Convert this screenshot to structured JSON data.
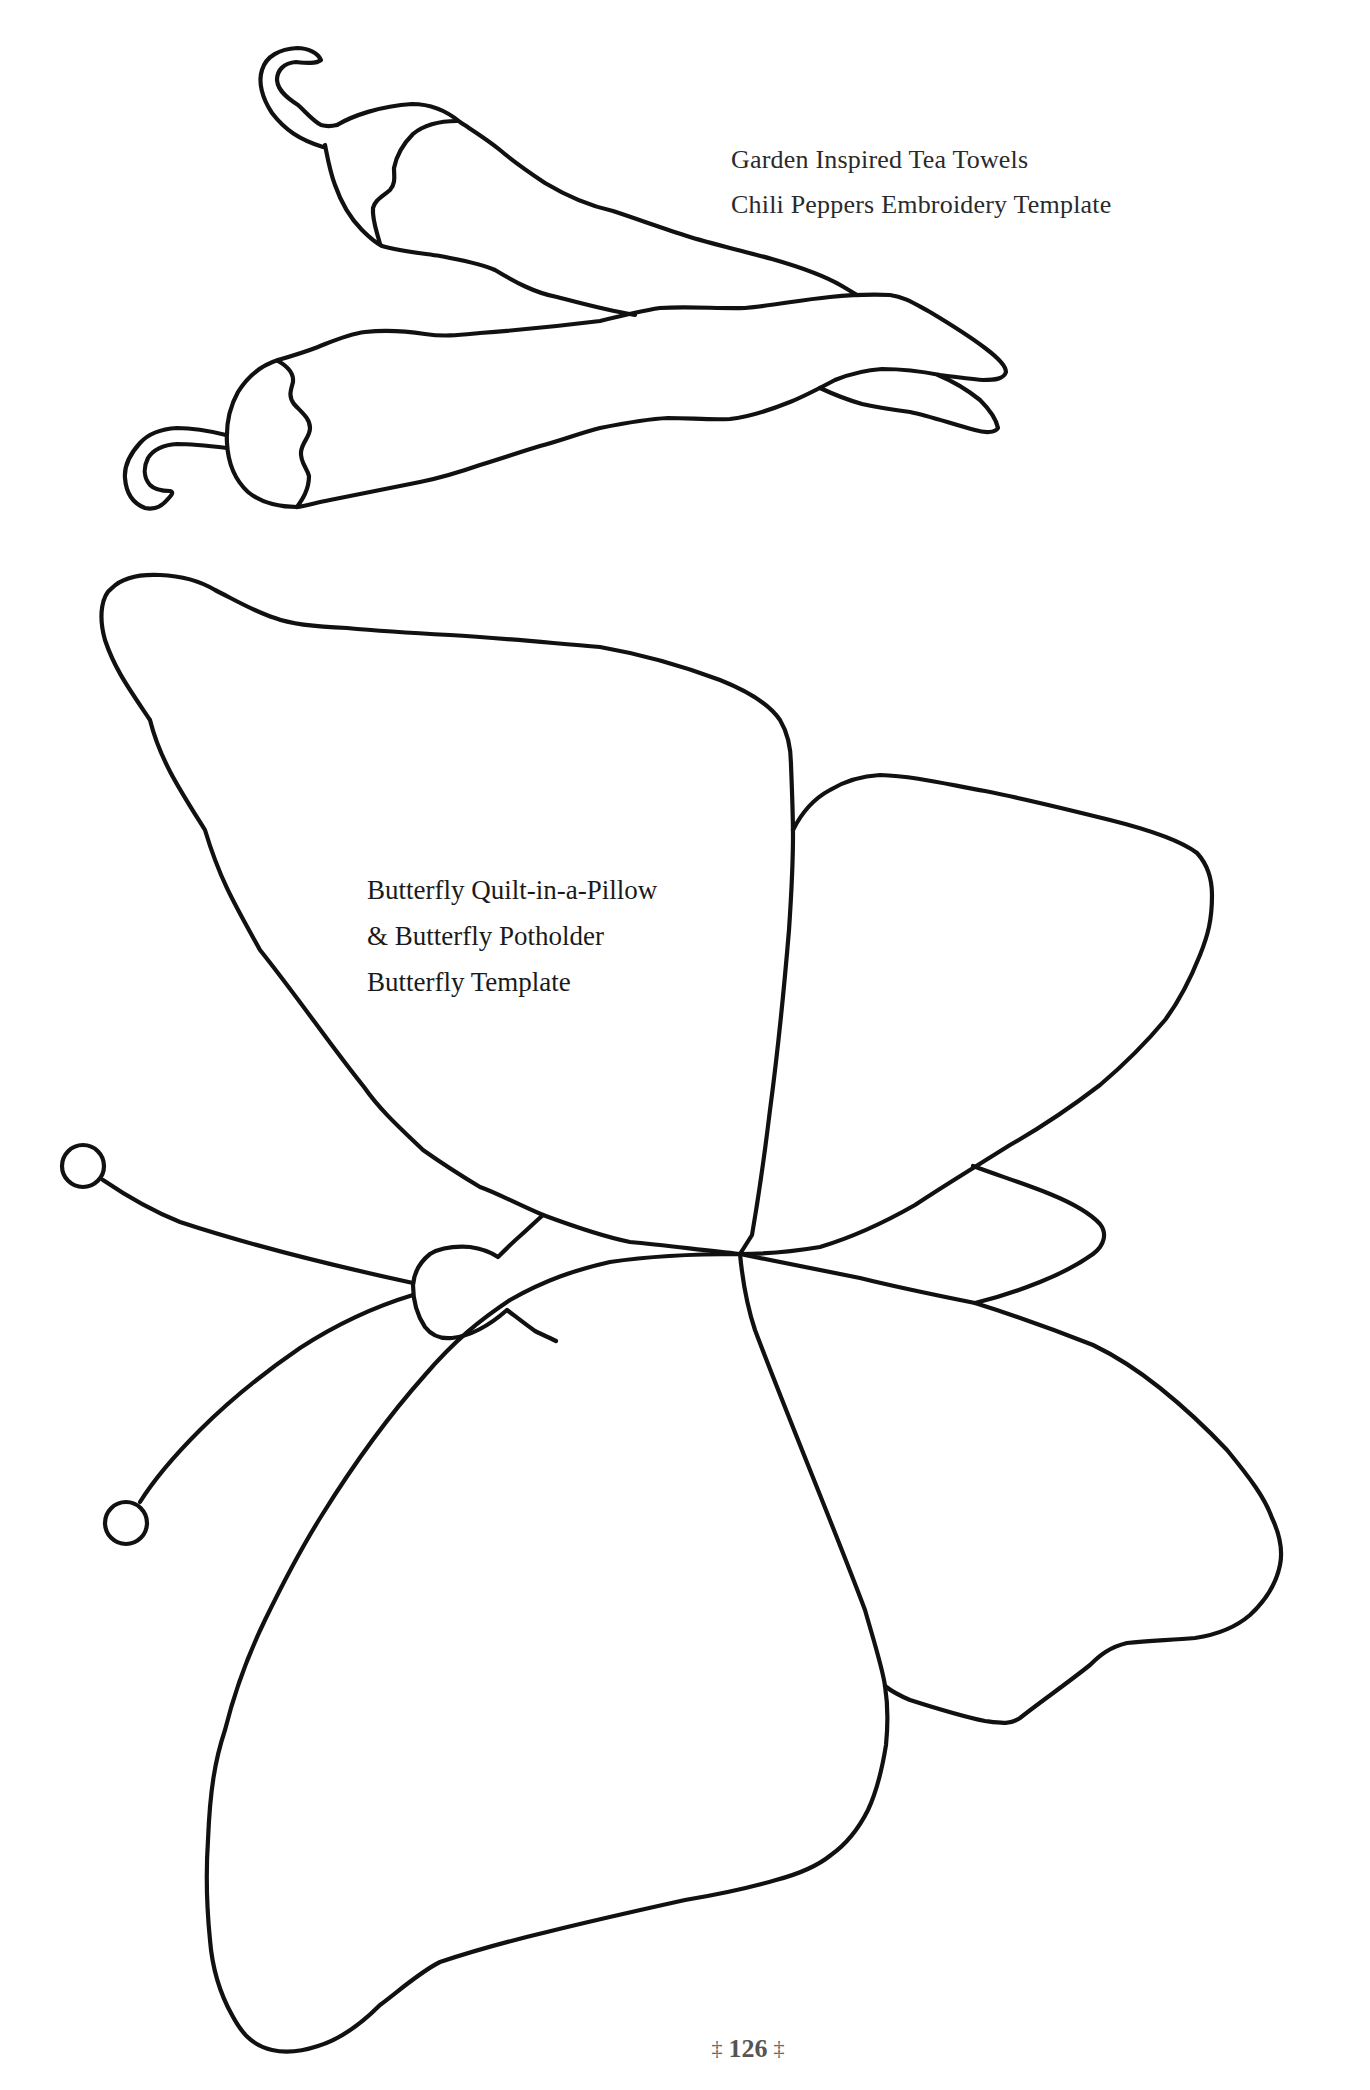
{
  "chili_template": {
    "title_lines": [
      "Garden Inspired Tea Towels",
      "Chili Peppers Embroidery Template"
    ],
    "illustration": "two-chili-peppers-outline"
  },
  "butterfly_template": {
    "title_lines": [
      "Butterfly Quilt-in-a-Pillow",
      "& Butterfly Potholder",
      "Butterfly Template"
    ],
    "illustration": "butterfly-outline"
  },
  "footer": {
    "ornament_left": "‡",
    "page_number": "126",
    "ornament_right": "‡"
  },
  "colors": {
    "background": "#ffffff",
    "line": "#111111",
    "text": "#2a2a2a"
  }
}
